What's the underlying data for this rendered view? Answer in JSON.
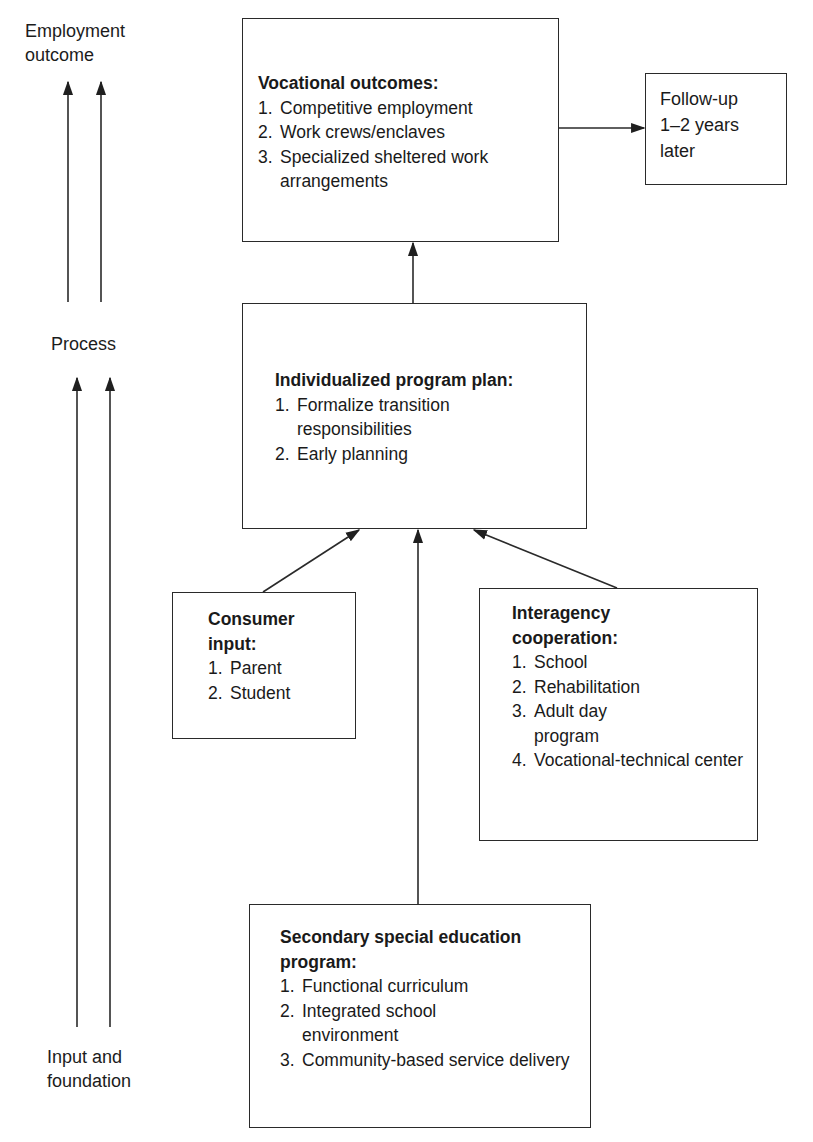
{
  "left_axis": {
    "top_label": "Employment\noutcome",
    "top_label_lines": [
      "Employment",
      "outcome"
    ],
    "middle_label": "Process",
    "bottom_label_lines": [
      "Input and",
      "foundation"
    ]
  },
  "boxes": {
    "vocational": {
      "title": "Vocational outcomes:",
      "items": [
        {
          "num": "1.",
          "text": "Competitive employment"
        },
        {
          "num": "2.",
          "text": "Work crews/enclaves"
        },
        {
          "num": "3.",
          "text": "Specialized sheltered work arrangements"
        }
      ]
    },
    "followup": {
      "lines": [
        "Follow-up",
        "1–2 years",
        "later"
      ]
    },
    "ipp": {
      "title": "Individualized program plan:",
      "items": [
        {
          "num": "1.",
          "text": "Formalize transition responsibilities"
        },
        {
          "num": "2.",
          "text": "Early planning"
        }
      ]
    },
    "consumer": {
      "title_lines": [
        "Consumer",
        "input:"
      ],
      "items": [
        {
          "num": "1.",
          "text": "Parent"
        },
        {
          "num": "2.",
          "text": "Student"
        }
      ]
    },
    "interagency": {
      "title_lines": [
        "Interagency",
        "cooperation:"
      ],
      "items": [
        {
          "num": "1.",
          "text": "School"
        },
        {
          "num": "2.",
          "text": "Rehabilitation"
        },
        {
          "num": "3.",
          "text": "Adult day program"
        },
        {
          "num": "4.",
          "text": "Vocational-technical center"
        }
      ]
    },
    "secondary": {
      "title_lines": [
        "Secondary special education",
        "program:"
      ],
      "items": [
        {
          "num": "1.",
          "text": "Functional curriculum"
        },
        {
          "num": "2.",
          "text": "Integrated school environment"
        },
        {
          "num": "3.",
          "text": "Community-based service delivery"
        }
      ]
    }
  },
  "colors": {
    "line": "#2a2a2a",
    "text": "#1c1c1c",
    "background": "#ffffff"
  }
}
